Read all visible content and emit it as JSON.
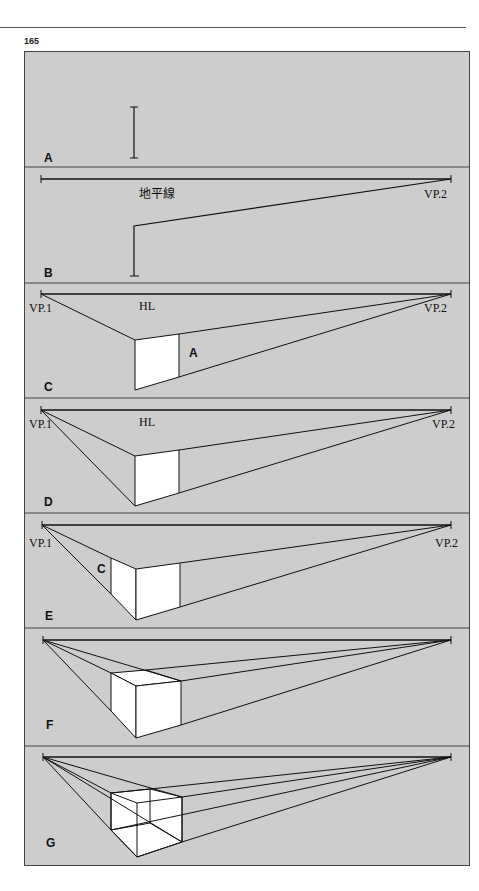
{
  "page": {
    "number": "165"
  },
  "colors": {
    "panel_bg": "#cdcdcd",
    "line": "#111111",
    "face": "#ffffff",
    "border": "#444444"
  },
  "panels": [
    {
      "id": "A",
      "label": "A",
      "top": 51,
      "bottom": 167
    },
    {
      "id": "B",
      "label": "B",
      "top": 167,
      "bottom": 283,
      "hl_label": "地平線",
      "vp2_label": "VP.2"
    },
    {
      "id": "C",
      "label": "C",
      "top": 283,
      "bottom": 398,
      "hl_label": "HL",
      "vp1_label": "VP.1",
      "vp2_label": "VP.2",
      "face_label": "A"
    },
    {
      "id": "D",
      "label": "D",
      "top": 398,
      "bottom": 513,
      "hl_label": "HL",
      "vp1_label": "VP.1",
      "vp2_label": "VP.2"
    },
    {
      "id": "E",
      "label": "E",
      "top": 513,
      "bottom": 628,
      "vp1_label": "VP.1",
      "vp2_label": "VP.2",
      "face_label": "C"
    },
    {
      "id": "F",
      "label": "F",
      "top": 628,
      "bottom": 746
    },
    {
      "id": "G",
      "label": "G",
      "top": 746,
      "bottom": 866
    }
  ]
}
